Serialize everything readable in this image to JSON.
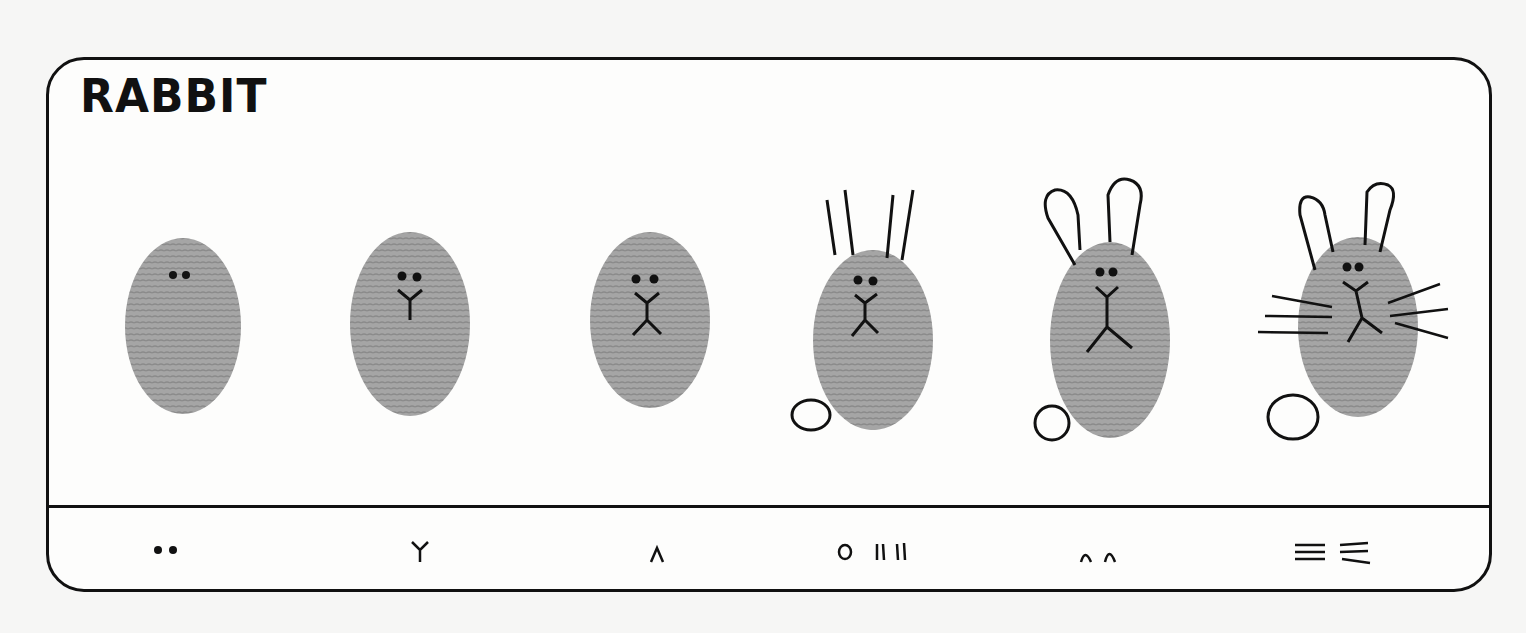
{
  "title": "RABBIT",
  "steps": [
    {
      "index": 1,
      "features": [
        "eyes"
      ],
      "legend_symbol": "••"
    },
    {
      "index": 2,
      "features": [
        "eyes",
        "nose"
      ],
      "legend_symbol": "Y"
    },
    {
      "index": 3,
      "features": [
        "eyes",
        "nose",
        "mouth"
      ],
      "legend_symbol": "∧"
    },
    {
      "index": 4,
      "features": [
        "eyes",
        "nose",
        "mouth",
        "tail",
        "ear-lines"
      ],
      "legend_symbol": "o ||||"
    },
    {
      "index": 5,
      "features": [
        "eyes",
        "nose",
        "mouth",
        "tail",
        "ear-loops"
      ],
      "legend_symbol": "∩∩"
    },
    {
      "index": 6,
      "features": [
        "eyes",
        "nose",
        "mouth",
        "tail",
        "ears",
        "whiskers"
      ],
      "legend_symbol": "≡ ≡"
    }
  ],
  "colors": {
    "ink": "#111111",
    "fingerprint": "#9a9a9a",
    "paper": "#fdfdfc"
  }
}
